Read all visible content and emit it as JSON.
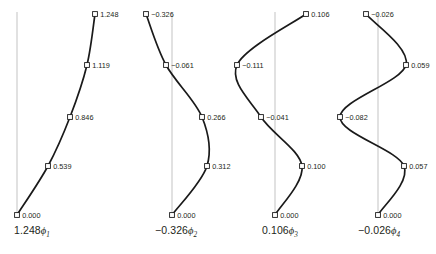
{
  "figure": {
    "background": "#ffffff",
    "curve_color": "#1a1a1a",
    "axis_color": "#c8c8c8",
    "marker_fill": "#ffffff",
    "text_color": "#231f20"
  },
  "chart_data": {
    "type": "line",
    "title": "",
    "xlabel": "",
    "ylabel": "",
    "grid": false,
    "legend": "none",
    "orientation": "vertical-mode-shapes",
    "panels": [
      {
        "id": "mode-1",
        "caption_coefficient": "1.248",
        "caption_symbol": "ϕ",
        "caption_subscript": "1",
        "caption_text": "1.248ϕ1",
        "axis_x": 17,
        "levels": [
          0,
          1,
          2,
          3,
          4
        ],
        "values": [
          0.0,
          0.539,
          0.846,
          1.119,
          1.248
        ],
        "labels": [
          "0.000",
          "0.539",
          "0.846",
          "1.119",
          "1.248"
        ],
        "points": [
          {
            "x": 17,
            "y": 215,
            "label": "0.000",
            "side": "right"
          },
          {
            "x": 48,
            "y": 166,
            "label": "0.539",
            "side": "right"
          },
          {
            "x": 70,
            "y": 117,
            "label": "0.846",
            "side": "right"
          },
          {
            "x": 87,
            "y": 65,
            "label": "1.119",
            "side": "right"
          },
          {
            "x": 95,
            "y": 14,
            "label": "1.248",
            "side": "right"
          }
        ]
      },
      {
        "id": "mode-2",
        "caption_coefficient": "−0.326",
        "caption_symbol": "ϕ",
        "caption_subscript": "2",
        "caption_text": "−0.326ϕ2",
        "axis_x": 172,
        "levels": [
          0,
          1,
          2,
          3,
          4
        ],
        "values": [
          0.0,
          0.312,
          0.266,
          -0.061,
          -0.326
        ],
        "labels": [
          "0.000",
          "0.312",
          "0.266",
          "−0.061",
          "−0.326"
        ],
        "points": [
          {
            "x": 172,
            "y": 215,
            "label": "0.000",
            "side": "right"
          },
          {
            "x": 207,
            "y": 166,
            "label": "0.312",
            "side": "right"
          },
          {
            "x": 202,
            "y": 117,
            "label": "0.266",
            "side": "right"
          },
          {
            "x": 166,
            "y": 65,
            "label": "−0.061",
            "side": "right"
          },
          {
            "x": 146,
            "y": 14,
            "label": "−0.326",
            "side": "right"
          }
        ]
      },
      {
        "id": "mode-3",
        "caption_coefficient": "0.106",
        "caption_symbol": "ϕ",
        "caption_subscript": "3",
        "caption_text": "0.106ϕ3",
        "axis_x": 275,
        "levels": [
          0,
          1,
          2,
          3,
          4
        ],
        "values": [
          0.0,
          0.1,
          -0.041,
          -0.111,
          0.106
        ],
        "labels": [
          "0.000",
          "0.100",
          "−0.041",
          "−0.111",
          "0.106"
        ],
        "points": [
          {
            "x": 275,
            "y": 215,
            "label": "0.000",
            "side": "right"
          },
          {
            "x": 302,
            "y": 166,
            "label": "0.100",
            "side": "right"
          },
          {
            "x": 261,
            "y": 117,
            "label": "−0.041",
            "side": "right"
          },
          {
            "x": 237,
            "y": 65,
            "label": "−0.111",
            "side": "right"
          },
          {
            "x": 306,
            "y": 14,
            "label": "0.106",
            "side": "right"
          }
        ]
      },
      {
        "id": "mode-4",
        "caption_coefficient": "−0.026",
        "caption_symbol": "ϕ",
        "caption_subscript": "4",
        "caption_text": "−0.026ϕ4",
        "axis_x": 378,
        "levels": [
          0,
          1,
          2,
          3,
          4
        ],
        "values": [
          0.0,
          0.057,
          -0.082,
          0.059,
          -0.026
        ],
        "labels": [
          "0.000",
          "0.057",
          "−0.082",
          "0.059",
          "−0.026"
        ],
        "points": [
          {
            "x": 378,
            "y": 215,
            "label": "0.000",
            "side": "right"
          },
          {
            "x": 404,
            "y": 166,
            "label": "0.057",
            "side": "right"
          },
          {
            "x": 340,
            "y": 117,
            "label": "−0.082",
            "side": "right"
          },
          {
            "x": 406,
            "y": 65,
            "label": "0.059",
            "side": "right"
          },
          {
            "x": 366,
            "y": 14,
            "label": "−0.026",
            "side": "right"
          }
        ]
      }
    ],
    "axis_top_y": 12,
    "axis_bottom_y": 216
  },
  "captions": [
    {
      "name": "caption-mode-1",
      "coef": "1.248",
      "sym": "ϕ",
      "sub": "1",
      "left": 14,
      "top": 224
    },
    {
      "name": "caption-mode-2",
      "coef": "−0.326",
      "sym": "ϕ",
      "sub": "2",
      "left": 155,
      "top": 224
    },
    {
      "name": "caption-mode-3",
      "coef": "0.106",
      "sym": "ϕ",
      "sub": "3",
      "left": 262,
      "top": 224
    },
    {
      "name": "caption-mode-4",
      "coef": "−0.026",
      "sym": "ϕ",
      "sub": "4",
      "left": 358,
      "top": 224
    }
  ]
}
